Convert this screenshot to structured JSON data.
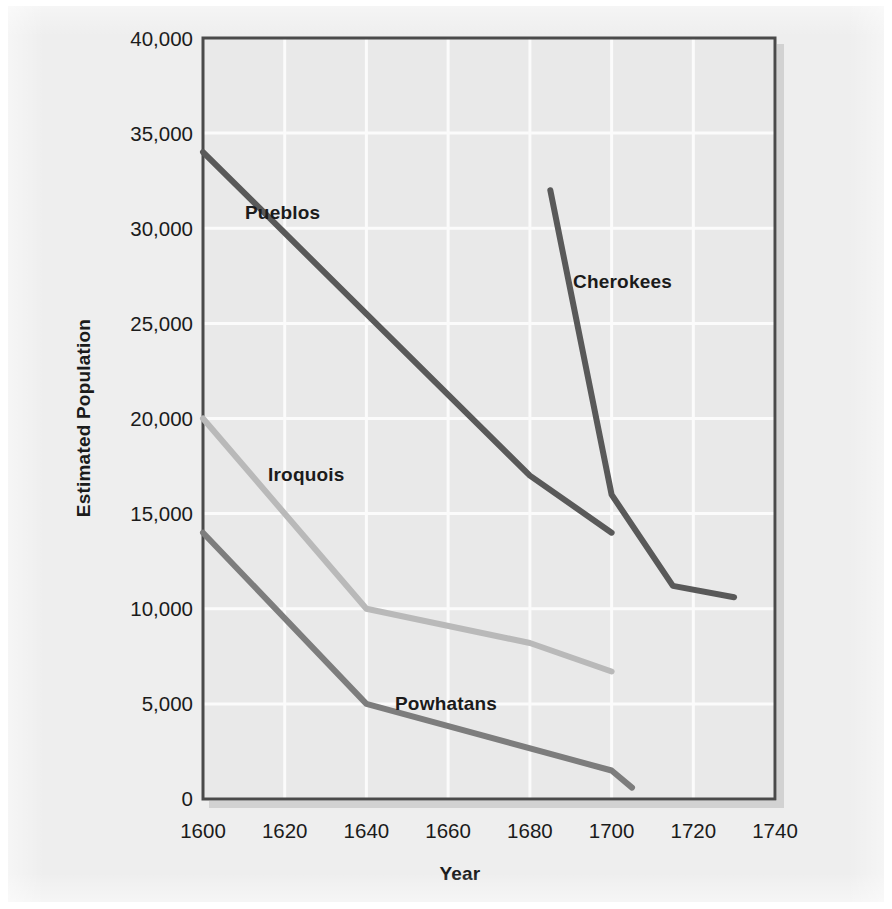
{
  "figure": {
    "background_color": "#eeeeee",
    "plot_background_color": "#e9e9e9",
    "frame_color": "#4a4a4a",
    "gridline_color": "#fbfbfb"
  },
  "axes": {
    "y_title": "Estimated Population",
    "x_title": "Year",
    "y_ticks": [
      "0",
      "5,000",
      "10,000",
      "15,000",
      "20,000",
      "25,000",
      "30,000",
      "35,000",
      "40,000"
    ],
    "x_ticks": [
      "1600",
      "1620",
      "1640",
      "1660",
      "1680",
      "1700",
      "1720",
      "1740"
    ]
  },
  "series_labels": {
    "pueblos": "Pueblos",
    "cherokees": "Cherokees",
    "iroquois": "Iroquois",
    "powhatans": "Powhatans"
  },
  "chart_data": {
    "type": "line",
    "title": "",
    "xlabel": "Year",
    "ylabel": "Estimated Population",
    "xlim": [
      1600,
      1740
    ],
    "ylim": [
      0,
      40000
    ],
    "xticks": [
      1600,
      1620,
      1640,
      1660,
      1680,
      1700,
      1720,
      1740
    ],
    "yticks": [
      0,
      5000,
      10000,
      15000,
      20000,
      25000,
      30000,
      35000,
      40000
    ],
    "grid": true,
    "legend": "inline-labels",
    "series": [
      {
        "name": "Pueblos",
        "color": "#595959",
        "linewidth": 5,
        "x": [
          1600,
          1680,
          1700
        ],
        "y": [
          34000,
          17000,
          14000
        ]
      },
      {
        "name": "Cherokees",
        "color": "#595959",
        "linewidth": 5,
        "x": [
          1685,
          1700,
          1715,
          1730
        ],
        "y": [
          32000,
          16000,
          11200,
          10600
        ]
      },
      {
        "name": "Iroquois",
        "color": "#b9b9b9",
        "linewidth": 5,
        "x": [
          1600,
          1640,
          1680,
          1700
        ],
        "y": [
          20000,
          10000,
          8200,
          6700
        ]
      },
      {
        "name": "Powhatans",
        "color": "#7d7d7d",
        "linewidth": 5,
        "x": [
          1600,
          1640,
          1700,
          1705
        ],
        "y": [
          14000,
          5000,
          1500,
          600
        ]
      }
    ],
    "annotations": [
      {
        "text": "Pueblos",
        "x": 1630,
        "y": 31200
      },
      {
        "text": "Cherokees",
        "x": 1703,
        "y": 27300
      },
      {
        "text": "Iroquois",
        "x": 1622,
        "y": 16700
      },
      {
        "text": "Powhatans",
        "x": 1649,
        "y": 4750
      }
    ]
  }
}
